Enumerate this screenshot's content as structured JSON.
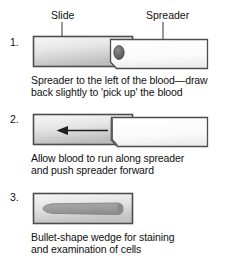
{
  "figure": {
    "title_labels": [
      {
        "id": "slide",
        "text": "Slide",
        "x": 51,
        "y": 9
      },
      {
        "id": "spreader",
        "text": "Spreader",
        "x": 146,
        "y": 9
      }
    ],
    "steps": [
      {
        "number": "1.",
        "number_x": 10,
        "number_y": 36,
        "caption": "Spreader to the left of the blood—draw\nback slightly to 'pick up' the blood",
        "caption_x": 31,
        "caption_y": 74,
        "slide_label": "Slide",
        "spreader_label": "Spreader",
        "blood_drop_label": "blood drop"
      },
      {
        "number": "2.",
        "number_x": 10,
        "number_y": 113,
        "caption": "Allow blood to run along spreader\nand push spreader forward",
        "caption_x": 31,
        "caption_y": 152,
        "arrow_direction": "left"
      },
      {
        "number": "3.",
        "number_x": 10,
        "number_y": 191,
        "caption": "Bullet-shape wedge for staining\nand examination of cells",
        "caption_x": 31,
        "caption_y": 231,
        "smear_shape": "bullet-shape wedge"
      }
    ],
    "colors": {
      "background": "#ffffff",
      "outline": "#4d4d4d",
      "slide_light": "#f4f4f4",
      "slide_mid": "#d8d8d8",
      "slide_shadow": "#b4b4b4",
      "spreader_fill": "#ffffff",
      "blood_drop": "#6e6e6e",
      "smear_fill": "#9d9d9d",
      "text": "#111111",
      "leader_line": "#333333"
    }
  }
}
